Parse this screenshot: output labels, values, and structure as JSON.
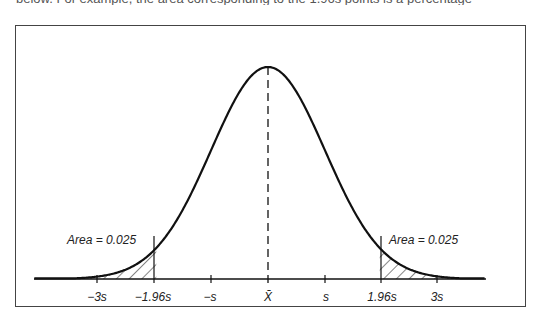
{
  "page": {
    "clipped_text": "below. For example, the area corresponding to the 1.96s points is a percentage"
  },
  "chart_data": {
    "type": "area",
    "title": "",
    "subtitle": "",
    "xlabel": "",
    "ylabel": "",
    "grid": false,
    "legend": null,
    "x_ticks": [
      {
        "value": -3,
        "label": "−3s"
      },
      {
        "value": -1.96,
        "label": "−1.96s"
      },
      {
        "value": -1,
        "label": "−s"
      },
      {
        "value": 0,
        "label": "X̄"
      },
      {
        "value": 1,
        "label": "s"
      },
      {
        "value": 1.96,
        "label": "1.96s"
      },
      {
        "value": 3,
        "label": "3s"
      }
    ],
    "xlim": [
      -4.1,
      3.8
    ],
    "distribution": {
      "name": "normal",
      "mean": 0,
      "sd": 1
    },
    "shaded_regions": [
      {
        "from": -4.1,
        "to": -1.96,
        "area": 0.025,
        "pattern": "hatch"
      },
      {
        "from": 1.96,
        "to": 3.8,
        "area": 0.025,
        "pattern": "hatch"
      }
    ],
    "annotations": [
      {
        "text": "Area = 0.025",
        "near": -1.96,
        "side": "left"
      },
      {
        "text": "Area = 0.025",
        "near": 1.96,
        "side": "right"
      }
    ],
    "mean_line": {
      "x": 0,
      "style": "dashed"
    }
  },
  "labels": {
    "left_area": "Area = 0.025",
    "right_area": "Area = 0.025",
    "tick_minus3": "−3s",
    "tick_minus196": "−1.96s",
    "tick_minus1": "−s",
    "tick_mean": "X̄",
    "tick_plus1": "s",
    "tick_plus196": "1.96s",
    "tick_plus3": "3s"
  }
}
